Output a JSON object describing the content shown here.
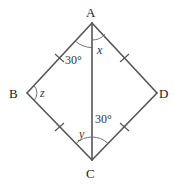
{
  "diagram": {
    "type": "rhombus-with-diagonal",
    "stroke_color": "#555555",
    "vertices": [
      {
        "id": "A",
        "label": "A",
        "x": 92,
        "y": 23
      },
      {
        "id": "B",
        "label": "B",
        "x": 27,
        "y": 93
      },
      {
        "id": "C",
        "label": "C",
        "x": 92,
        "y": 160
      },
      {
        "id": "D",
        "label": "D",
        "x": 157,
        "y": 93
      }
    ],
    "edges": [
      {
        "from": "A",
        "to": "B",
        "equal_tick": true
      },
      {
        "from": "B",
        "to": "C",
        "equal_tick": true
      },
      {
        "from": "C",
        "to": "D",
        "equal_tick": true
      },
      {
        "from": "D",
        "to": "A",
        "equal_tick": true
      },
      {
        "from": "A",
        "to": "C",
        "equal_tick": false
      }
    ],
    "angles": [
      {
        "id": "angle-BAC",
        "vertex": "A",
        "label": "30°"
      },
      {
        "id": "angle-CAD",
        "vertex": "A",
        "label": "x"
      },
      {
        "id": "angle-ABC",
        "vertex": "B",
        "label": "z"
      },
      {
        "id": "angle-BCA",
        "vertex": "C",
        "label": "y"
      },
      {
        "id": "angle-ACD",
        "vertex": "C",
        "label": "30°"
      }
    ]
  }
}
